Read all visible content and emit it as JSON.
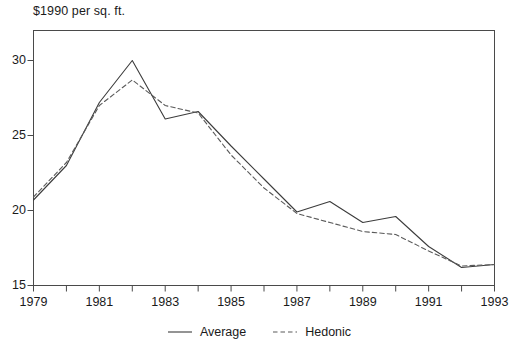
{
  "chart_data": {
    "type": "line",
    "title": "$1990 per sq. ft.",
    "xlabel": "",
    "ylabel": "",
    "x": [
      1979,
      1980,
      1981,
      1982,
      1983,
      1984,
      1985,
      1986,
      1987,
      1988,
      1989,
      1990,
      1991,
      1992,
      1993
    ],
    "xlim": [
      1979,
      1993
    ],
    "ylim": [
      15,
      32
    ],
    "xticks": [
      1979,
      1980,
      1981,
      1982,
      1983,
      1984,
      1985,
      1986,
      1987,
      1988,
      1989,
      1990,
      1991,
      1992,
      1993
    ],
    "xtick_labels": [
      "1979",
      "",
      "1981",
      "",
      "1983",
      "",
      "1985",
      "",
      "1987",
      "",
      "1989",
      "",
      "1991",
      "",
      "1993"
    ],
    "yticks": [
      15,
      20,
      25,
      30
    ],
    "ytick_labels": [
      "15",
      "20",
      "25",
      "30"
    ],
    "grid": false,
    "legend_position": "below-center",
    "frame": true,
    "series": [
      {
        "name": "Average",
        "style": "solid",
        "color": "#3c3c3c",
        "values": [
          20.7,
          23.0,
          27.2,
          30.0,
          26.1,
          26.6,
          24.3,
          22.1,
          19.9,
          20.6,
          19.2,
          19.6,
          17.6,
          16.2,
          16.4
        ]
      },
      {
        "name": "Hedonic",
        "style": "dashed",
        "color": "#5a5a5a",
        "values": [
          20.9,
          23.2,
          27.0,
          28.7,
          27.0,
          26.5,
          23.7,
          21.5,
          19.8,
          19.2,
          18.6,
          18.4,
          17.3,
          16.3,
          16.4
        ]
      }
    ]
  },
  "legend": {
    "entries": [
      {
        "label": "Average"
      },
      {
        "label": "Hedonic"
      }
    ]
  }
}
